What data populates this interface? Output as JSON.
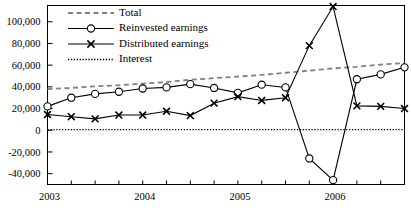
{
  "chart_data": {
    "type": "line",
    "title": "",
    "subtitle": "",
    "xlabel": "",
    "ylabel": "",
    "grid": false,
    "legend_position": "top-left",
    "x": [
      "2003Q1",
      "2003Q2",
      "2003Q3",
      "2003Q4",
      "2004Q1",
      "2004Q2",
      "2004Q3",
      "2004Q4",
      "2005Q1",
      "2005Q2",
      "2005Q3",
      "2005Q4",
      "2006Q1",
      "2006Q2",
      "2006Q3",
      "2006Q4"
    ],
    "x_tick_labels": [
      "2003",
      "2004",
      "2005",
      "2006"
    ],
    "x_tick_positions": [
      0,
      4,
      8,
      12
    ],
    "xlim": [
      0,
      15
    ],
    "ylim": [
      -50000,
      115000
    ],
    "y_ticks": [
      -40000,
      -20000,
      0,
      20000,
      40000,
      60000,
      80000,
      100000
    ],
    "y_tick_labels": [
      "-40,000",
      "-20,000",
      "0",
      "20,000",
      "40,000",
      "60,000",
      "80,000",
      "100,000"
    ],
    "series": [
      {
        "name": "Total",
        "marker": "none",
        "style": "dashed",
        "color": "#808080",
        "values": [
          38000,
          39000,
          40500,
          41500,
          43000,
          44500,
          46500,
          48000,
          49500,
          51000,
          53000,
          55000,
          57000,
          58500,
          60500,
          62000
        ]
      },
      {
        "name": "Reinvested earnings",
        "marker": "circle",
        "style": "solid",
        "color": "#000000",
        "values": [
          22000,
          30000,
          33500,
          35500,
          38500,
          39500,
          42500,
          39000,
          34500,
          42000,
          39500,
          -26000,
          -46000,
          47000,
          51500,
          58000
        ]
      },
      {
        "name": "Distributed earnings",
        "marker": "x",
        "style": "solid",
        "color": "#000000",
        "values": [
          14500,
          12500,
          10500,
          14000,
          14000,
          17500,
          13500,
          25000,
          31000,
          27500,
          30000,
          78000,
          114000,
          22500,
          22000,
          20000
        ]
      },
      {
        "name": "Interest",
        "marker": "none",
        "style": "dotted",
        "color": "#000000",
        "values": [
          500,
          500,
          500,
          500,
          500,
          500,
          500,
          500,
          500,
          500,
          500,
          500,
          500,
          500,
          500,
          500
        ]
      }
    ]
  },
  "legend": {
    "items": [
      {
        "label": "Total",
        "key": "total"
      },
      {
        "label": "Reinvested earnings",
        "key": "reinvested-earnings"
      },
      {
        "label": "Distributed earnings",
        "key": "distributed-earnings"
      },
      {
        "label": "Interest",
        "key": "interest"
      }
    ]
  }
}
